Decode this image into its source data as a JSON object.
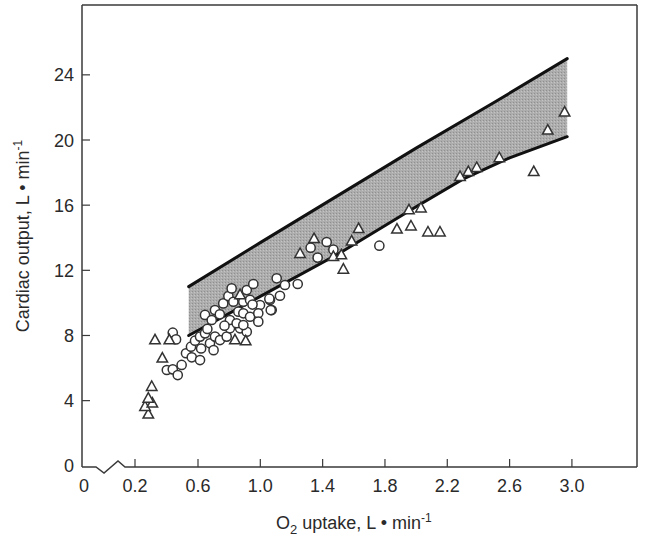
{
  "chart_data": {
    "type": "scatter",
    "title": "",
    "xlabel": "O2 uptake, L • min-1",
    "xlabel_parts": {
      "o": "O",
      "sub": "2",
      "rest": " uptake, L • min",
      "sup": "-1"
    },
    "ylabel": "Cardiac output, L • min-1",
    "ylabel_parts": {
      "main": "Cardiac output, L • min",
      "sup": "-1"
    },
    "xlim": [
      0,
      3.4
    ],
    "ylim": [
      0,
      27
    ],
    "x_axis_break": true,
    "x_ticks": [
      {
        "value": 0,
        "label": "0"
      },
      {
        "value": 0.2,
        "label": "0.2"
      },
      {
        "value": 0.6,
        "label": "0.6"
      },
      {
        "value": 1.0,
        "label": "1.0"
      },
      {
        "value": 1.4,
        "label": "1.4"
      },
      {
        "value": 1.8,
        "label": "1.8"
      },
      {
        "value": 2.2,
        "label": "2.2"
      },
      {
        "value": 2.6,
        "label": "2.6"
      },
      {
        "value": 3.0,
        "label": "3.0"
      }
    ],
    "y_ticks": [
      {
        "value": 0,
        "label": "0"
      },
      {
        "value": 4,
        "label": "4"
      },
      {
        "value": 8,
        "label": "8"
      },
      {
        "value": 12,
        "label": "12"
      },
      {
        "value": 16,
        "label": "16"
      },
      {
        "value": 20,
        "label": "20"
      },
      {
        "value": 24,
        "label": "24"
      }
    ],
    "grid": false,
    "legend": null,
    "band": {
      "description": "Shaded reference range of cardiac output vs O2 uptake",
      "fill": "#a9a9a9",
      "line_color": "#111111",
      "upper": [
        [
          0.54,
          11.0
        ],
        [
          1.0,
          13.7
        ],
        [
          1.5,
          16.6
        ],
        [
          2.0,
          19.5
        ],
        [
          2.5,
          22.3
        ],
        [
          2.97,
          25.0
        ]
      ],
      "lower": [
        [
          0.54,
          8.0
        ],
        [
          1.0,
          10.4
        ],
        [
          1.5,
          13.0
        ],
        [
          2.0,
          15.9
        ],
        [
          2.3,
          17.6
        ],
        [
          2.6,
          18.9
        ],
        [
          2.97,
          20.2
        ]
      ]
    },
    "series": [
      {
        "name": "circles",
        "marker": "circle",
        "points": [
          [
            0.438,
            8.17
          ],
          [
            0.459,
            7.76
          ],
          [
            0.4,
            5.88
          ],
          [
            0.438,
            5.92
          ],
          [
            0.47,
            5.57
          ],
          [
            0.495,
            6.19
          ],
          [
            0.523,
            6.91
          ],
          [
            0.56,
            6.66
          ],
          [
            0.613,
            6.49
          ],
          [
            0.555,
            7.31
          ],
          [
            0.581,
            7.68
          ],
          [
            0.613,
            7.93
          ],
          [
            0.645,
            8.13
          ],
          [
            0.677,
            7.52
          ],
          [
            0.709,
            7.93
          ],
          [
            0.741,
            7.72
          ],
          [
            0.784,
            7.93
          ],
          [
            0.805,
            8.44
          ],
          [
            0.87,
            8.44
          ],
          [
            0.913,
            8.23
          ],
          [
            0.645,
            9.26
          ],
          [
            0.688,
            8.95
          ],
          [
            0.709,
            9.56
          ],
          [
            0.762,
            9.97
          ],
          [
            0.795,
            10.42
          ],
          [
            0.816,
            10.89
          ],
          [
            0.913,
            10.79
          ],
          [
            0.955,
            11.16
          ],
          [
            0.827,
            10.07
          ],
          [
            0.891,
            10.07
          ],
          [
            0.934,
            10.18
          ],
          [
            0.998,
            9.87
          ],
          [
            1.062,
            10.18
          ],
          [
            1.105,
            11.51
          ],
          [
            0.859,
            9.46
          ],
          [
            0.891,
            9.36
          ],
          [
            0.934,
            9.15
          ],
          [
            0.987,
            9.36
          ],
          [
            0.805,
            8.95
          ],
          [
            0.848,
            8.75
          ],
          [
            0.891,
            8.64
          ],
          [
            0.987,
            8.85
          ],
          [
            1.073,
            9.56
          ],
          [
            1.24,
            11.16
          ],
          [
            1.158,
            11.1
          ],
          [
            1.126,
            10.44
          ],
          [
            1.058,
            10.26
          ],
          [
            1.067,
            9.56
          ],
          [
            1.426,
            13.74
          ],
          [
            1.323,
            13.39
          ],
          [
            1.469,
            13.27
          ],
          [
            1.368,
            12.78
          ],
          [
            1.764,
            13.51
          ],
          [
            0.74,
            9.3
          ],
          [
            0.77,
            8.6
          ],
          [
            0.66,
            8.4
          ],
          [
            0.62,
            7.2
          ],
          [
            0.7,
            7.1
          ],
          [
            0.95,
            9.9
          ]
        ]
      },
      {
        "name": "triangles",
        "marker": "triangle",
        "points": [
          [
            0.324,
            7.72
          ],
          [
            0.281,
            3.16
          ],
          [
            0.26,
            3.63
          ],
          [
            0.307,
            3.84
          ],
          [
            0.281,
            4.14
          ],
          [
            0.303,
            4.86
          ],
          [
            0.371,
            6.6
          ],
          [
            0.416,
            7.72
          ],
          [
            0.87,
            10.49
          ],
          [
            0.837,
            7.72
          ],
          [
            0.906,
            7.66
          ],
          [
            1.255,
            13.02
          ],
          [
            1.345,
            13.94
          ],
          [
            1.469,
            12.84
          ],
          [
            1.52,
            12.94
          ],
          [
            1.533,
            12.06
          ],
          [
            1.586,
            13.78
          ],
          [
            1.631,
            14.55
          ],
          [
            1.877,
            14.52
          ],
          [
            1.967,
            14.71
          ],
          [
            2.076,
            14.34
          ],
          [
            2.153,
            14.34
          ],
          [
            1.954,
            15.7
          ],
          [
            2.031,
            15.82
          ],
          [
            2.282,
            17.75
          ],
          [
            2.335,
            18.05
          ],
          [
            2.389,
            18.3
          ],
          [
            2.534,
            18.9
          ],
          [
            2.755,
            18.05
          ],
          [
            2.845,
            20.6
          ],
          [
            2.953,
            21.7
          ]
        ]
      }
    ]
  }
}
